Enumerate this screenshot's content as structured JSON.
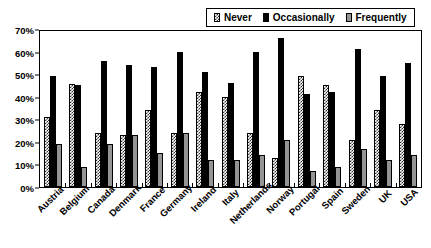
{
  "chart_data": {
    "type": "bar",
    "title": "",
    "subtitle": "",
    "xlabel": "",
    "ylabel": "",
    "ylim": [
      0,
      70
    ],
    "ytick_step": 10,
    "ytick_labels": [
      "0%",
      "10%",
      "20%",
      "30%",
      "40%",
      "50%",
      "60%",
      "70%"
    ],
    "ytick_values": [
      0,
      10,
      20,
      30,
      40,
      50,
      60,
      70
    ],
    "grid": false,
    "legend_position": "top-right",
    "categories": [
      "Austria",
      "Belgium",
      "Canada",
      "Denmark",
      "France",
      "Germany",
      "Ireland",
      "Italy",
      "Netherlands",
      "Norway",
      "Portugal",
      "Spain",
      "Sweden",
      "UK",
      "USA"
    ],
    "series": [
      {
        "name": "Never",
        "pattern": "checkered",
        "color": "#555555",
        "values": [
          31,
          45.5,
          24,
          23,
          34,
          24,
          42,
          40,
          24,
          13,
          49,
          45,
          21,
          34,
          28
        ]
      },
      {
        "name": "Occasionally",
        "pattern": "solid",
        "color": "#000000",
        "values": [
          49,
          45,
          56,
          54,
          53,
          60,
          51,
          46,
          60,
          66,
          41,
          42,
          61,
          49,
          55
        ]
      },
      {
        "name": "Frequently",
        "pattern": "gray",
        "color": "#949494",
        "values": [
          19,
          9,
          19,
          23,
          15,
          24,
          12,
          12,
          14,
          21,
          7,
          9,
          17,
          12,
          14
        ]
      }
    ]
  }
}
